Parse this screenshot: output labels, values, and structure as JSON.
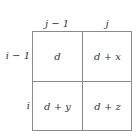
{
  "columns": [
    "j − 1",
    "j"
  ],
  "rows": [
    "i − 1",
    "i"
  ],
  "cells": [
    [
      "d",
      "d + x"
    ],
    [
      "d + y",
      "d + z"
    ]
  ]
}
